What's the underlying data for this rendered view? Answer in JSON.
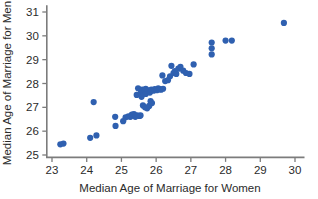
{
  "chart_data": {
    "type": "scatter",
    "title": "",
    "xlabel": "Median Age of Marriage for Women",
    "ylabel": "Median Age of Marriage for Men",
    "xlim": [
      22.85,
      30.25
    ],
    "ylim": [
      24.9,
      31.25
    ],
    "xticks": [
      23,
      24,
      25,
      26,
      27,
      28,
      29,
      30
    ],
    "yticks": [
      25,
      26,
      27,
      28,
      29,
      30,
      31
    ],
    "xticklabels": [
      "23",
      "24",
      "25",
      "26",
      "27",
      "28",
      "29",
      "30"
    ],
    "yticklabels": [
      "25",
      "26",
      "27",
      "28",
      "29",
      "30",
      "31"
    ],
    "grid": false,
    "legend": null,
    "marker_color": "#2f60b0",
    "marker_size": 3.1,
    "axis_color": "#7c7c7c",
    "series": [
      {
        "name": "states",
        "points": [
          [
            23.24,
            25.45
          ],
          [
            23.33,
            25.48
          ],
          [
            24.1,
            25.72
          ],
          [
            24.28,
            25.82
          ],
          [
            24.2,
            27.22
          ],
          [
            24.82,
            26.6
          ],
          [
            24.83,
            26.22
          ],
          [
            25.05,
            26.42
          ],
          [
            25.12,
            26.58
          ],
          [
            25.2,
            26.62
          ],
          [
            25.26,
            26.6
          ],
          [
            25.3,
            26.7
          ],
          [
            25.36,
            26.72
          ],
          [
            25.4,
            26.6
          ],
          [
            25.45,
            26.66
          ],
          [
            25.52,
            26.64
          ],
          [
            25.55,
            26.66
          ],
          [
            25.44,
            27.52
          ],
          [
            25.48,
            27.8
          ],
          [
            25.56,
            27.62
          ],
          [
            25.6,
            27.74
          ],
          [
            25.62,
            27.66
          ],
          [
            25.66,
            27.72
          ],
          [
            25.7,
            27.78
          ],
          [
            25.74,
            27.72
          ],
          [
            25.7,
            27.56
          ],
          [
            25.58,
            27.44
          ],
          [
            25.62,
            27.08
          ],
          [
            25.68,
            27.0
          ],
          [
            25.74,
            26.96
          ],
          [
            25.8,
            27.06
          ],
          [
            25.84,
            27.26
          ],
          [
            25.88,
            27.18
          ],
          [
            25.82,
            27.62
          ],
          [
            25.86,
            27.74
          ],
          [
            25.92,
            27.7
          ],
          [
            25.96,
            27.76
          ],
          [
            26.02,
            27.72
          ],
          [
            26.06,
            27.8
          ],
          [
            26.1,
            27.76
          ],
          [
            26.14,
            27.74
          ],
          [
            26.18,
            28.34
          ],
          [
            26.2,
            27.78
          ],
          [
            26.26,
            28.1
          ],
          [
            26.34,
            28.14
          ],
          [
            26.4,
            28.3
          ],
          [
            26.44,
            28.74
          ],
          [
            26.5,
            28.44
          ],
          [
            26.54,
            28.52
          ],
          [
            26.58,
            28.4
          ],
          [
            26.64,
            28.62
          ],
          [
            26.7,
            28.7
          ],
          [
            26.78,
            28.54
          ],
          [
            26.86,
            28.44
          ],
          [
            26.96,
            28.4
          ],
          [
            27.08,
            28.8
          ],
          [
            27.6,
            29.22
          ],
          [
            27.6,
            29.48
          ],
          [
            27.6,
            29.72
          ],
          [
            28.0,
            29.8
          ],
          [
            28.18,
            29.8
          ],
          [
            29.68,
            30.54
          ]
        ]
      }
    ]
  }
}
